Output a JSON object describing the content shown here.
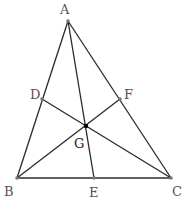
{
  "diagram": {
    "type": "triangle-medians",
    "points": {
      "A": {
        "label": "A",
        "x": 68,
        "y": 21
      },
      "B": {
        "label": "B",
        "x": 17,
        "y": 178
      },
      "C": {
        "label": "C",
        "x": 171,
        "y": 178
      },
      "D": {
        "label": "D",
        "x": 42,
        "y": 99
      },
      "E": {
        "label": "E",
        "x": 94,
        "y": 178
      },
      "F": {
        "label": "F",
        "x": 120,
        "y": 99
      },
      "G": {
        "label": "G",
        "x": 86,
        "y": 126
      }
    },
    "segments": [
      [
        "A",
        "B"
      ],
      [
        "B",
        "C"
      ],
      [
        "C",
        "A"
      ],
      [
        "A",
        "E"
      ],
      [
        "B",
        "F"
      ],
      [
        "C",
        "D"
      ]
    ],
    "colors": {
      "line": "#2a2a2a",
      "point": "#777777",
      "centroid": "#000000",
      "label": "#555555"
    }
  }
}
